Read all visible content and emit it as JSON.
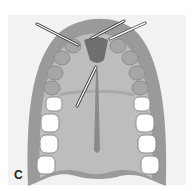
{
  "figure": {
    "panel_label": "C",
    "colors": {
      "background": "#f2f2f2",
      "outer_gum": "#9a9a9a",
      "palate": "#bdbdbd",
      "inner_band": "#a9a9a9",
      "incisive_papilla": "#6f6f6f",
      "tooth": "#ffffff",
      "pointer": "#ffffff",
      "pointer_outline": "#333333"
    },
    "pointers": [
      {
        "from": [
          37,
          24
        ],
        "to": [
          78,
          45
        ]
      },
      {
        "from": [
          124,
          21
        ],
        "to": [
          92,
          38
        ]
      },
      {
        "from": [
          145,
          23
        ],
        "to": [
          110,
          39
        ]
      },
      {
        "from": [
          77,
          106
        ],
        "to": [
          96,
          67
        ]
      }
    ]
  }
}
